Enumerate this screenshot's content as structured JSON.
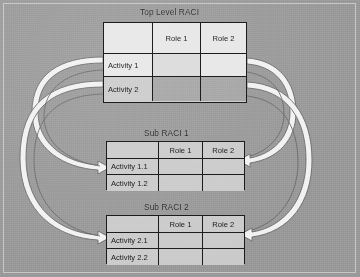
{
  "diagram": {
    "title_visible": false,
    "background_color": "#9d9d9d",
    "tables": [
      {
        "id": "top",
        "title": "Top Level RACI",
        "columns": [
          "",
          "Role 1",
          "Role 2"
        ],
        "rows": [
          {
            "label": "Activity 1",
            "cells": [
              "",
              ""
            ]
          },
          {
            "label": "Activity 2",
            "cells": [
              "",
              ""
            ]
          }
        ]
      },
      {
        "id": "sub1",
        "title": "Sub RACI 1",
        "columns": [
          "",
          "Role 1",
          "Role 2"
        ],
        "rows": [
          {
            "label": "Activity 1.1",
            "cells": [
              "",
              ""
            ]
          },
          {
            "label": "Activity 1.2",
            "cells": [
              "",
              ""
            ]
          }
        ]
      },
      {
        "id": "sub2",
        "title": "Sub RACI 2",
        "columns": [
          "",
          "Role 1",
          "Role 2"
        ],
        "rows": [
          {
            "label": "Activity 2.1",
            "cells": [
              "",
              ""
            ]
          },
          {
            "label": "Activity 2.2",
            "cells": [
              "",
              ""
            ]
          }
        ]
      }
    ],
    "connectors": [
      {
        "name": "activity-1-to-sub-raci-1-activities",
        "from": "top.Activity 1",
        "to": "sub1.activities",
        "side": "left"
      },
      {
        "name": "activity-2-to-sub-raci-2-activities",
        "from": "top.Activity 2",
        "to": "sub2.activities",
        "side": "left"
      },
      {
        "name": "top-row-1-to-sub-raci-1-role-2",
        "from": "top.Activity 1",
        "to": "sub1.Role 2",
        "side": "right"
      },
      {
        "name": "top-row-2-to-sub-raci-2-role-2",
        "from": "top.Activity 2",
        "to": "sub2.Role 2",
        "side": "right"
      }
    ]
  }
}
